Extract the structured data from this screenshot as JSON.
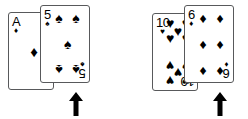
{
  "scene": {
    "description": "Two pairs of overlapping playing cards, each pair marked by an upward arrow",
    "background_color": "#ffffff",
    "ink_color": "#000000",
    "card_border_color": "#58595b"
  },
  "suits": {
    "spade": "♠",
    "heart": "♥",
    "diamond": "♦",
    "club": "♣"
  },
  "groups": [
    {
      "id": "left",
      "name": "left-card-pair",
      "cards": [
        {
          "id": "ace-diamonds",
          "name": "card-ace-of-diamonds",
          "rank": "A",
          "suit_name": "diamond",
          "suit_glyph": "♦",
          "position": "back",
          "pip_count": 1
        },
        {
          "id": "5-spades",
          "name": "card-5-of-spades",
          "rank": "5",
          "suit_name": "spade",
          "suit_glyph": "♠",
          "position": "front",
          "pip_count": 5
        }
      ],
      "arrow": {
        "name": "arrow-pointing-up-left",
        "direction": "up",
        "points_at": "card-5-of-spades"
      }
    },
    {
      "id": "right",
      "name": "right-card-pair",
      "cards": [
        {
          "id": "10-hearts",
          "name": "card-10-of-hearts",
          "rank": "10",
          "suit_name": "heart",
          "suit_glyph": "♥",
          "position": "back",
          "pip_count": 10
        },
        {
          "id": "6-diamonds",
          "name": "card-6-of-diamonds",
          "rank": "6",
          "suit_name": "diamond",
          "suit_glyph": "♦",
          "position": "front",
          "pip_count": 6
        }
      ],
      "arrow": {
        "name": "arrow-pointing-up-right",
        "direction": "up",
        "points_at": "card-6-of-diamonds"
      }
    }
  ]
}
